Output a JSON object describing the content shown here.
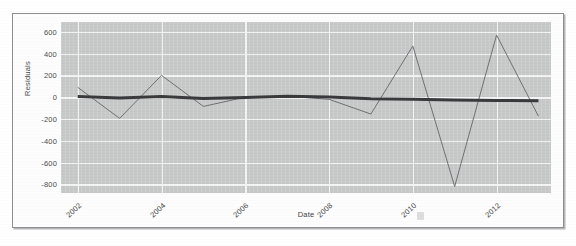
{
  "figure": {
    "kind": "residuals-line-plot",
    "background_color": "#ffffff",
    "frame_border_color": "#8d8f93"
  },
  "chart_data": {
    "type": "line",
    "title": "",
    "xlabel": "Date",
    "ylabel": "Residuals",
    "x": [
      2002,
      2003,
      2004,
      2005,
      2006,
      2007,
      2008,
      2009,
      2010,
      2011,
      2012,
      2013
    ],
    "xlim": [
      2001.6,
      2013.3
    ],
    "ylim": [
      -880,
      690
    ],
    "xticks": [
      2002,
      2004,
      2006,
      2008,
      2010,
      2012
    ],
    "xticklabels": [
      "2002",
      "2004",
      "2006",
      "2008",
      "2010",
      "2012"
    ],
    "yticks": [
      600,
      400,
      200,
      0,
      -200,
      -400,
      -600,
      -800
    ],
    "yticklabels": [
      "600",
      "400",
      "200",
      "0",
      "-200",
      "-400",
      "-600",
      "-800"
    ],
    "grid": true,
    "grid_color": "#f4f4f4",
    "plot_background": "#c8c9c9",
    "legend": "none",
    "series": [
      {
        "name": "Residuals",
        "color": "#6e7074",
        "linewidth": 1,
        "values": [
          90,
          -195,
          200,
          -85,
          0,
          10,
          -20,
          -155,
          470,
          -820,
          570,
          -175
        ]
      },
      {
        "name": "Smoothed trend",
        "color": "#3a3a3c",
        "linewidth": 3,
        "values": [
          5,
          -8,
          5,
          -12,
          -3,
          8,
          2,
          -14,
          -20,
          -26,
          -30,
          -32
        ]
      }
    ]
  },
  "axes": {
    "y_title": "Residuals",
    "x_title": "Date"
  }
}
